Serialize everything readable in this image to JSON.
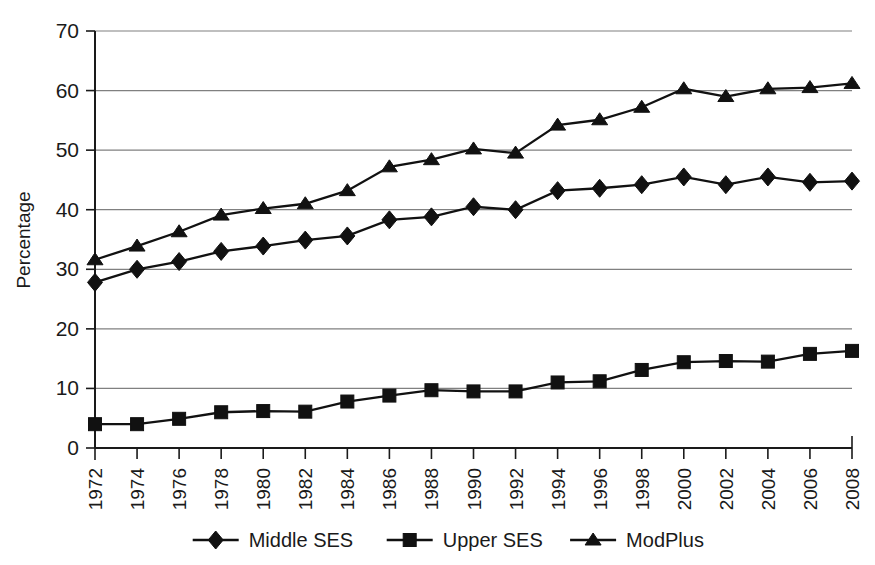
{
  "chart_data": {
    "type": "line",
    "title": "",
    "subtitle": "",
    "xlabel": "",
    "ylabel": "Percentage",
    "x": [
      1972,
      1974,
      1976,
      1978,
      1980,
      1982,
      1984,
      1986,
      1988,
      1990,
      1992,
      1994,
      1996,
      1998,
      2000,
      2002,
      2004,
      2006,
      2008
    ],
    "categories": [
      "1972",
      "1974",
      "1976",
      "1978",
      "1980",
      "1982",
      "1984",
      "1986",
      "1988",
      "1990",
      "1992",
      "1994",
      "1996",
      "1998",
      "2000",
      "2002",
      "2004",
      "2006",
      "2008"
    ],
    "xlim": [
      1972,
      2008
    ],
    "ylim": [
      0,
      70
    ],
    "yticks": [
      0,
      10,
      20,
      30,
      40,
      50,
      60,
      70
    ],
    "ytick_labels": [
      "0",
      "10",
      "20",
      "30",
      "40",
      "50",
      "60",
      "70"
    ],
    "grid": "horizontal",
    "legend_position": "bottom",
    "series": [
      {
        "name": "Middle SES",
        "marker": "diamond",
        "values": [
          27.8,
          30.0,
          31.3,
          33.0,
          33.9,
          34.9,
          35.6,
          38.3,
          38.8,
          40.5,
          40.0,
          43.2,
          43.6,
          44.2,
          45.5,
          44.2,
          45.5,
          44.6,
          44.8
        ]
      },
      {
        "name": "Upper SES",
        "marker": "square",
        "values": [
          4.0,
          4.0,
          4.9,
          6.0,
          6.2,
          6.1,
          7.8,
          8.8,
          9.7,
          9.5,
          9.5,
          11.0,
          11.2,
          13.1,
          14.4,
          14.6,
          14.5,
          15.8,
          16.3
        ]
      },
      {
        "name": "ModPlus",
        "marker": "triangle",
        "values": [
          31.6,
          33.9,
          36.3,
          39.1,
          40.2,
          41.0,
          43.2,
          47.2,
          48.4,
          50.2,
          49.5,
          54.2,
          55.1,
          57.2,
          60.3,
          59.0,
          60.3,
          60.5,
          61.2
        ]
      }
    ]
  },
  "legend": {
    "items": [
      {
        "label": "Middle SES",
        "marker": "diamond"
      },
      {
        "label": "Upper SES",
        "marker": "square"
      },
      {
        "label": "ModPlus",
        "marker": "triangle"
      }
    ]
  },
  "colors": {
    "series": "#111111",
    "grid": "#808080",
    "axis": "#1a1a1a",
    "background": "#ffffff"
  }
}
